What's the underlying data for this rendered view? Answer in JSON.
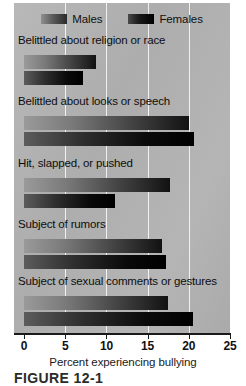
{
  "chart_data": {
    "type": "bar",
    "orientation": "horizontal",
    "title": "",
    "xlabel": "Percent experiencing bullying",
    "ylabel": "",
    "xlim": [
      0,
      25
    ],
    "xticks": [
      0,
      5,
      10,
      15,
      20,
      25
    ],
    "xtick_labels": [
      "0",
      "5",
      "10",
      "15",
      "20",
      "25"
    ],
    "grid": "vertical-white-gridlines",
    "legend_position": "top-center",
    "categories": [
      "Belittled about religion or race",
      "Belittled about looks or speech",
      "Hit, slapped, or pushed",
      "Subject of rumors",
      "Subject of sexual comments or gestures"
    ],
    "series": [
      {
        "name": "Males",
        "color": "#6b6b6b",
        "values": [
          8.7,
          20.0,
          17.7,
          16.7,
          17.5
        ]
      },
      {
        "name": "Females",
        "color": "#111111",
        "values": [
          7.2,
          20.6,
          11.0,
          17.2,
          20.5
        ]
      }
    ]
  },
  "legend": {
    "items": [
      {
        "label": "Males",
        "swatch": "males-swatch"
      },
      {
        "label": "Females",
        "swatch": "females-swatch"
      }
    ]
  },
  "axis": {
    "title": "Percent experiencing bullying",
    "ticks": [
      "0",
      "5",
      "10",
      "15",
      "20",
      "25"
    ]
  },
  "caption": {
    "text": "FIGURE 12-1"
  }
}
